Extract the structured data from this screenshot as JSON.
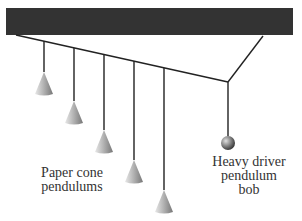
{
  "diagram": {
    "support_bar_color": "#333333",
    "labels": {
      "cones": "Paper cone\npendulums",
      "driver": "Heavy driver\npendulum\nbob"
    },
    "pendulums": [
      {
        "type": "cone",
        "x": 44,
        "tip_y": 72,
        "base_y": 95
      },
      {
        "type": "cone",
        "x": 74,
        "tip_y": 101,
        "base_y": 125
      },
      {
        "type": "cone",
        "x": 104,
        "tip_y": 130,
        "base_y": 153
      },
      {
        "type": "cone",
        "x": 134,
        "tip_y": 160,
        "base_y": 183
      },
      {
        "type": "cone",
        "x": 164,
        "tip_y": 190,
        "base_y": 213
      },
      {
        "type": "ball",
        "x": 228,
        "y": 143,
        "r": 7
      }
    ]
  }
}
